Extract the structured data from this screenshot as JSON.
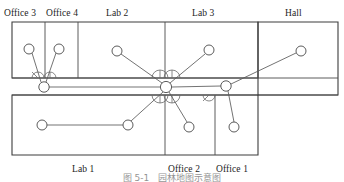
{
  "figure": {
    "caption": "图 5-1　园林地图示意图",
    "kind": "floor-plan-diagram"
  },
  "labels": {
    "top": [
      {
        "id": "office-3",
        "text": "Office 3",
        "x": 4,
        "y": 8
      },
      {
        "id": "office-4",
        "text": "Office 4",
        "x": 46,
        "y": 8
      },
      {
        "id": "lab-2",
        "text": "Lab 2",
        "x": 106,
        "y": 8
      },
      {
        "id": "lab-3",
        "text": "Lab 3",
        "x": 192,
        "y": 8
      },
      {
        "id": "hall",
        "text": "Hall",
        "x": 285,
        "y": 8
      }
    ],
    "bottom": [
      {
        "id": "lab-1",
        "text": "Lab 1",
        "x": 72,
        "y": 164
      },
      {
        "id": "office-2",
        "text": "Office 2",
        "x": 168,
        "y": 164
      },
      {
        "id": "office-1",
        "text": "Office 1",
        "x": 216,
        "y": 164
      }
    ]
  },
  "geometry": {
    "walls": [
      {
        "name": "top-block-outline",
        "d": "M 12 22 L 258 22 L 258 78 L 12 78 Z"
      },
      {
        "name": "hall-outline",
        "d": "M 258 22 L 338 22 L 338 95 L 258 95 Z"
      },
      {
        "name": "corridor-top",
        "d": "M 12 78 L 338 78"
      },
      {
        "name": "corridor-bottom",
        "d": "M 12 95 L 338 95"
      },
      {
        "name": "bottom-block-outline",
        "d": "M 12 95 L 258 95 L 258 155 L 12 155 Z"
      },
      {
        "name": "divider-office3-office4",
        "d": "M 45 22 L 45 78"
      },
      {
        "name": "divider-office4-lab2",
        "d": "M 78 22 L 78 78"
      },
      {
        "name": "divider-lab2-lab3",
        "d": "M 165 22 L 165 78"
      },
      {
        "name": "divider-lab1-office2",
        "d": "M 165 95 L 165 155"
      },
      {
        "name": "divider-office2-office1",
        "d": "M 215 95 L 215 155"
      }
    ],
    "doors": [
      {
        "name": "door-office3",
        "cx": 38,
        "cy": 78,
        "r": 6,
        "side": "up",
        "leaf": "M 38 78 L 32 72"
      },
      {
        "name": "door-office4",
        "cx": 50,
        "cy": 78,
        "r": 6,
        "side": "up",
        "leaf": "M 50 78 L 50 72"
      },
      {
        "name": "door-lab2",
        "cx": 160,
        "cy": 78,
        "r": 8,
        "side": "up",
        "leaf": "M 160 78 L 160 70"
      },
      {
        "name": "door-lab3",
        "cx": 172,
        "cy": 78,
        "r": 8,
        "side": "up",
        "leaf": "M 172 78 L 172 70"
      },
      {
        "name": "door-lab1",
        "cx": 160,
        "cy": 95,
        "r": 8,
        "side": "down",
        "leaf": "M 160 95 L 160 103"
      },
      {
        "name": "door-office2",
        "cx": 172,
        "cy": 95,
        "r": 8,
        "side": "down",
        "leaf": "M 172 95 L 172 103"
      },
      {
        "name": "door-office1",
        "cx": 209,
        "cy": 95,
        "r": 6,
        "side": "down",
        "leaf": "M 209 95 L 203 101"
      }
    ],
    "nodes": [
      {
        "id": "n-office3",
        "cx": 29,
        "cy": 49,
        "r": 5.0
      },
      {
        "id": "n-office4",
        "cx": 59,
        "cy": 49,
        "r": 5.0
      },
      {
        "id": "n-lab2",
        "cx": 117,
        "cy": 51,
        "r": 5.0
      },
      {
        "id": "n-lab3",
        "cx": 209,
        "cy": 50,
        "r": 5.0
      },
      {
        "id": "n-hall",
        "cx": 301,
        "cy": 51,
        "r": 5.0
      },
      {
        "id": "n-corr-w",
        "cx": 44,
        "cy": 87,
        "r": 5.2
      },
      {
        "id": "n-hub",
        "cx": 166,
        "cy": 87,
        "r": 5.6
      },
      {
        "id": "n-corr-e",
        "cx": 226,
        "cy": 86,
        "r": 5.2
      },
      {
        "id": "n-lab1-w",
        "cx": 42,
        "cy": 125,
        "r": 5.0
      },
      {
        "id": "n-lab1-e",
        "cx": 128,
        "cy": 125,
        "r": 5.0
      },
      {
        "id": "n-office2",
        "cx": 189,
        "cy": 127,
        "r": 5.0
      },
      {
        "id": "n-office1",
        "cx": 234,
        "cy": 127,
        "r": 5.0
      }
    ],
    "links": [
      {
        "from": "n-office3",
        "to": "n-corr-w",
        "d": "M 32 53 L 41 82"
      },
      {
        "from": "n-office4",
        "to": "n-corr-w",
        "d": "M 56 53 L 46 82"
      },
      {
        "from": "n-lab2",
        "to": "n-hub",
        "d": "M 121 54 L 162 83"
      },
      {
        "from": "n-lab3",
        "to": "n-hub",
        "d": "M 205 54 L 170 83"
      },
      {
        "from": "n-hall",
        "to": "n-corr-e",
        "d": "M 296 53 L 231 84"
      },
      {
        "from": "n-corr-w",
        "to": "n-hub",
        "d": "M 49 87 L 160 87"
      },
      {
        "from": "n-hub",
        "to": "n-corr-e",
        "d": "M 172 87 L 221 86"
      },
      {
        "from": "n-hub",
        "to": "n-lab1-e",
        "d": "M 163 92 L 131 121"
      },
      {
        "from": "n-hub",
        "to": "n-office2",
        "d": "M 169 92 L 187 122"
      },
      {
        "from": "n-lab1-w",
        "to": "n-lab1-e",
        "d": "M 47 125 L 123 125"
      },
      {
        "from": "n-corr-e",
        "to": "n-office1",
        "d": "M 228 91 L 234 122"
      }
    ]
  },
  "colors": {
    "wall": "#4a4a4a",
    "link": "#5a5a5a",
    "node_fill": "#ffffff",
    "door": "#6a6a6a",
    "text": "#1d1d1d",
    "background": "#ffffff"
  }
}
